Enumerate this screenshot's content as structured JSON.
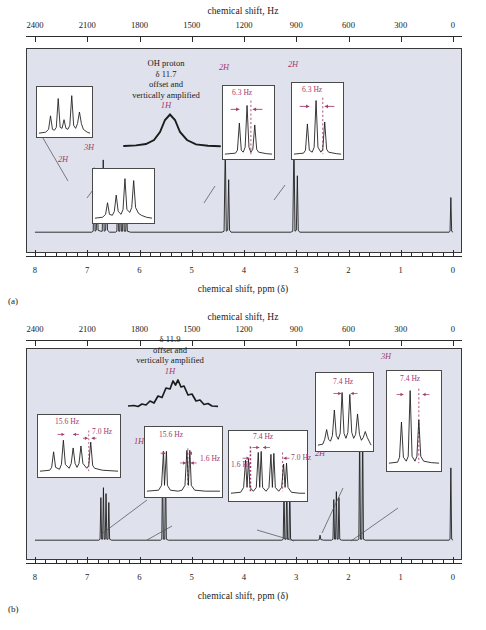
{
  "figure": {
    "panels": [
      {
        "letter": "(a)",
        "top_axis_title": "chemical shift, Hz",
        "bottom_axis_title": "chemical shift, ppm (δ)",
        "hz_ticks": [
          2400,
          2100,
          1800,
          1500,
          1200,
          900,
          600,
          300,
          0
        ],
        "ppm_ticks": [
          8,
          7,
          6,
          5,
          4,
          3,
          2,
          1,
          0
        ],
        "note": {
          "lines": [
            "OH proton",
            "δ 11.7",
            "offset and",
            "vertically amplified"
          ],
          "integration": "1H",
          "ppm": 5.75
        },
        "peak_labels": [
          {
            "text": "2H",
            "ppm": 7.24
          },
          {
            "text": "3H",
            "ppm": 6.9
          },
          {
            "text": "2H",
            "ppm": 4.2
          },
          {
            "text": "2H",
            "ppm": 2.85
          }
        ],
        "insets": [
          {
            "name": "aromatic-multiplet-inset",
            "peaks": 5,
            "j_labels": []
          },
          {
            "name": "aromatic-multiplet-inset-2",
            "peaks": 5,
            "j_labels": []
          },
          {
            "name": "triplet-inset-4ppm",
            "peaks": 3,
            "j_labels": [
              "6.3 Hz"
            ]
          },
          {
            "name": "triplet-inset-3ppm",
            "peaks": 3,
            "j_labels": [
              "6.3 Hz"
            ]
          }
        ]
      },
      {
        "letter": "(b)",
        "top_axis_title": "chemical shift, Hz",
        "bottom_axis_title": "chemical shift, ppm (δ)",
        "hz_ticks": [
          2400,
          2100,
          1800,
          1500,
          1200,
          900,
          600,
          300,
          0
        ],
        "ppm_ticks": [
          8,
          7,
          6,
          5,
          4,
          3,
          2,
          1,
          0
        ],
        "note": {
          "lines": [
            "δ 11.9",
            "offset and",
            "vertically amplified"
          ],
          "integration": "1H",
          "ppm": 5.0
        },
        "peak_labels": [
          {
            "text": "1H",
            "ppm": 7.05
          },
          {
            "text": "1H",
            "ppm": 5.82
          },
          {
            "text": "2H",
            "ppm": 2.2
          },
          {
            "text": "2H",
            "ppm": 1.5
          },
          {
            "text": "3H",
            "ppm": 0.95
          }
        ],
        "insets": [
          {
            "name": "ddd-inset-7ppm",
            "peaks": 5,
            "j_labels": [
              "15.6 Hz",
              "7.0 Hz"
            ]
          },
          {
            "name": "dd-inset-58ppm",
            "peaks": 2,
            "j_labels": [
              "15.6 Hz",
              "1.6 Hz"
            ]
          },
          {
            "name": "multiplet-inset-32ppm",
            "peaks": 4,
            "j_labels": [
              "7.4 Hz",
              "1.6 Hz",
              "7.0 Hz"
            ]
          },
          {
            "name": "sextet-inset-15ppm",
            "peaks": 6,
            "j_labels": [
              "7.4 Hz"
            ]
          },
          {
            "name": "triplet-inset-09ppm",
            "peaks": 3,
            "j_labels": [
              "7.4 Hz"
            ]
          }
        ]
      }
    ],
    "colors": {
      "plot_background": "#dfe2ec",
      "trace": "#1c1c1c",
      "annotation_magenta": "#a23a6d",
      "axis": "#2b2b2b",
      "page_background": "#ffffff"
    }
  },
  "chart_data": {
    "type": "line",
    "title": "",
    "subtitle": "",
    "xlabel": "chemical shift, ppm (δ)",
    "ylabel": "",
    "xlim": [
      8,
      0
    ],
    "grid": false,
    "legend": null,
    "secondary_axis": {
      "label": "chemical shift, Hz",
      "xlim": [
        2400,
        0
      ],
      "ticks": [
        2400,
        2100,
        1800,
        1500,
        1200,
        900,
        600,
        300,
        0
      ]
    },
    "series": [
      {
        "name": "(a) 1H NMR spectrum",
        "peaks": [
          {
            "ppm": 7.3,
            "intensity": 0.72,
            "assignment": "2H",
            "multiplicity": "m"
          },
          {
            "ppm": 7.22,
            "intensity": 0.84,
            "assignment": "2H",
            "multiplicity": "m"
          },
          {
            "ppm": 6.92,
            "intensity": 0.78,
            "assignment": "3H",
            "multiplicity": "m"
          },
          {
            "ppm": 6.86,
            "intensity": 0.62,
            "assignment": "3H",
            "multiplicity": "m"
          },
          {
            "ppm": 4.18,
            "intensity": 0.92,
            "assignment": "2H",
            "multiplicity": "t",
            "J": "6.3 Hz"
          },
          {
            "ppm": 2.85,
            "intensity": 0.95,
            "assignment": "2H",
            "multiplicity": "t",
            "J": "6.3 Hz"
          },
          {
            "ppm": 0.0,
            "intensity": 0.3,
            "assignment": "TMS",
            "multiplicity": "s"
          }
        ],
        "offset_peak": {
          "ppm": 11.7,
          "assignment": "1H",
          "note": "OH proton, offset and vertically amplified"
        }
      },
      {
        "name": "(b) 1H NMR spectrum",
        "peaks": [
          {
            "ppm": 7.07,
            "intensity": 0.55,
            "assignment": "1H",
            "multiplicity": "ddd",
            "J": "15.6, 7.0 Hz"
          },
          {
            "ppm": 5.82,
            "intensity": 0.92,
            "assignment": "1H",
            "multiplicity": "dd",
            "J": "15.6, 1.6 Hz"
          },
          {
            "ppm": 2.2,
            "intensity": 0.72,
            "assignment": "2H",
            "multiplicity": "m",
            "J": "7.4, 1.6, 7.0 Hz"
          },
          {
            "ppm": 1.5,
            "intensity": 0.66,
            "assignment": "2H",
            "multiplicity": "sextet",
            "J": "7.4 Hz"
          },
          {
            "ppm": 0.95,
            "intensity": 0.97,
            "assignment": "3H",
            "multiplicity": "t",
            "J": "7.4 Hz"
          },
          {
            "ppm": 0.0,
            "intensity": 0.55,
            "assignment": "TMS",
            "multiplicity": "s"
          }
        ],
        "offset_peak": {
          "ppm": 11.9,
          "assignment": "1H",
          "note": "offset and vertically amplified"
        }
      }
    ]
  }
}
